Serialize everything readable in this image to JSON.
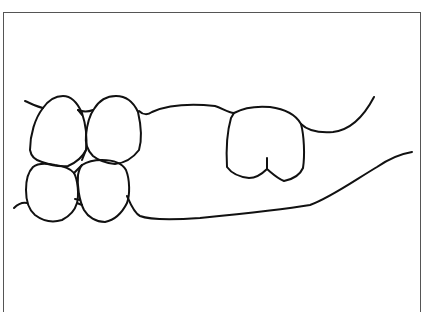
{
  "diagram": {
    "stroke_color": "#111111",
    "frame_color": "#555555",
    "background": "#ffffff",
    "elements": [
      {
        "id": "upper-left-tooth-1",
        "type": "tooth"
      },
      {
        "id": "upper-left-tooth-2",
        "type": "tooth"
      },
      {
        "id": "lower-left-tooth-1",
        "type": "tooth"
      },
      {
        "id": "lower-left-tooth-2",
        "type": "tooth"
      },
      {
        "id": "isolated-molar",
        "type": "tooth"
      },
      {
        "id": "upper-gum-line",
        "type": "gum-line"
      },
      {
        "id": "lower-gum-line",
        "type": "gum-line"
      }
    ]
  }
}
